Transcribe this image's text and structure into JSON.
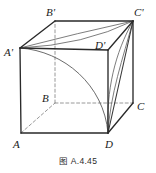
{
  "figure": {
    "type": "geometry-diagram",
    "shape": "cube",
    "caption": "图 A.4.45",
    "stroke_color": "#2a2a2a",
    "hidden_stroke_color": "#8c8c8c",
    "curve_color": "#6e6e6e",
    "background": "#ffffff",
    "vertices": [
      {
        "name": "A-prime",
        "label": "A'",
        "x": 20,
        "y": 48,
        "label_x": 4,
        "label_y": 52,
        "hidden": false
      },
      {
        "name": "B-prime",
        "label": "B'",
        "x": 55,
        "y": 21,
        "label_x": 44,
        "label_y": 13,
        "hidden": false
      },
      {
        "name": "C-prime",
        "label": "C'",
        "x": 133,
        "y": 21,
        "label_x": 136,
        "label_y": 13,
        "hidden": false
      },
      {
        "name": "D-prime",
        "label": "D'",
        "x": 108,
        "y": 50,
        "label_x": 96,
        "label_y": 47,
        "hidden": false
      },
      {
        "name": "A",
        "label": "A",
        "x": 21,
        "y": 133,
        "label_x": 10,
        "label_y": 146,
        "hidden": false
      },
      {
        "name": "B",
        "label": "B",
        "x": 55,
        "y": 103,
        "label_x": 42,
        "label_y": 101,
        "hidden": true
      },
      {
        "name": "C",
        "label": "C",
        "x": 133,
        "y": 103,
        "label_x": 137,
        "label_y": 108,
        "hidden": false
      },
      {
        "name": "D",
        "label": "D",
        "x": 108,
        "y": 133,
        "label_x": 105,
        "label_y": 147,
        "hidden": false
      }
    ],
    "solid_edges": [
      {
        "name": "edge-A-D",
        "from": "A",
        "to": "D"
      },
      {
        "name": "edge-A-Aprime",
        "from": "A",
        "to": "A'"
      },
      {
        "name": "edge-D-C",
        "from": "D",
        "to": "C"
      },
      {
        "name": "edge-D-Dprime",
        "from": "D",
        "to": "D'"
      },
      {
        "name": "edge-C-Cprime",
        "from": "C",
        "to": "C'"
      },
      {
        "name": "edge-Aprime-Bprime",
        "from": "A'",
        "to": "B'"
      },
      {
        "name": "edge-Bprime-Cprime",
        "from": "B'",
        "to": "C'"
      },
      {
        "name": "edge-Aprime-Dprime",
        "from": "A'",
        "to": "D'"
      },
      {
        "name": "edge-Dprime-Cprime",
        "from": "D'",
        "to": "C'"
      }
    ],
    "hidden_edges": [
      {
        "name": "edge-A-B-hidden",
        "from": "A",
        "to": "B"
      },
      {
        "name": "edge-B-C-hidden",
        "from": "B",
        "to": "C"
      },
      {
        "name": "edge-B-Bprime-hidden",
        "from": "B",
        "to": "B'"
      }
    ],
    "curves": [
      {
        "name": "arc-top-Aprime-to-Cprime",
        "description": "arc on top face from A' bulging toward B'C' up to C'",
        "path": "M 20 48 Q 78 34 133 21"
      },
      {
        "name": "arc-top-Aprime-to-Cprime-inner",
        "description": "second near-straight curve on top face from A' to C'",
        "path": "M 20 48 Q 80 44 133 21"
      },
      {
        "name": "arc-front-Aprime-to-D",
        "description": "quarter arc on front face from A' down to D",
        "path": "M 20 48 C 62 50 103 86 108 133"
      },
      {
        "name": "arc-right-Cprime-to-D",
        "description": "arc on right face from C' down to D",
        "path": "M 133 21 C 116 54 107 92 108 133"
      },
      {
        "name": "chord-Cprime-to-D",
        "description": "straight chord from C' to D",
        "path": "M 133 21 L 108 133"
      },
      {
        "name": "arc-right-Cprime-to-D-outer",
        "description": "outer arc on right face from C' toward D",
        "path": "M 133 21 C 122 58 110 96 108 133"
      }
    ]
  }
}
